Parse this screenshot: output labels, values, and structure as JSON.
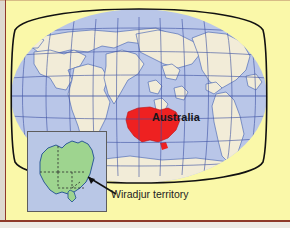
{
  "figure": {
    "type": "world-map-with-inset",
    "background_color": "#faf8a9",
    "frame_color": "#8e3a2a"
  },
  "globe": {
    "projection": "robinson",
    "ocean_color": "#b9c6e8",
    "land_color": "#f2ecd8",
    "graticule_color": "#3b4fa0",
    "outline_color": "#111111",
    "highlight_country": "Australia",
    "highlight_color": "#ee2222"
  },
  "labels": {
    "australia": "Australia",
    "wiradjur": "Wiradjur territory"
  },
  "inset": {
    "title": "Australia detail",
    "land_color": "#9ed48f",
    "water_color": "#b9c7e6",
    "border_color": "#5d5d5d",
    "state_border_style": "dashed",
    "outline_color": "#2d5a96"
  },
  "pointer": {
    "color": "#111111",
    "from": "Wiradjur territory",
    "to": "south-eastern Australia"
  }
}
